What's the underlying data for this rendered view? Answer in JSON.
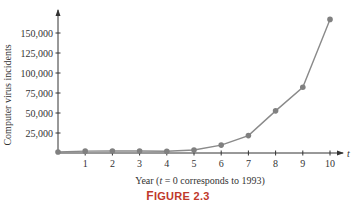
{
  "chart_data": {
    "type": "line",
    "title": "",
    "xlabel": "Year (t = 0 corresponds to 1993)",
    "ylabel": "Computer virus incidents",
    "x_axis_symbol": "t",
    "x": [
      0,
      1,
      2,
      3,
      4,
      5,
      6,
      7,
      8,
      9,
      10
    ],
    "values": [
      1334,
      2340,
      2412,
      2573,
      2134,
      3734,
      9859,
      21756,
      52658,
      82094,
      167000
    ],
    "x_ticks": [
      "1",
      "2",
      "3",
      "4",
      "5",
      "6",
      "7",
      "8",
      "9",
      "10"
    ],
    "y_ticks": [
      "25,000",
      "50,000",
      "75,000",
      "100,000",
      "125,000",
      "150,000"
    ],
    "y_tick_values": [
      25000,
      50000,
      75000,
      100000,
      125000,
      150000
    ],
    "xlim": [
      0,
      10.5
    ],
    "ylim": [
      0,
      170000
    ],
    "grid": false,
    "legend": null,
    "line_color": "#8a8a8a",
    "marker_color": "#808080"
  },
  "caption": {
    "prefix_big": "F",
    "rest": "IGURE 2.3"
  }
}
